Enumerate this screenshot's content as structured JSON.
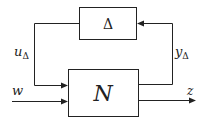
{
  "diagram": {
    "type": "block-diagram",
    "blocks": {
      "delta": {
        "label": "Δ"
      },
      "plant": {
        "label": "N"
      }
    },
    "signals": {
      "u_delta": {
        "base": "u",
        "sub": "Δ"
      },
      "y_delta": {
        "base": "y",
        "sub": "Δ"
      },
      "w": {
        "label": "w"
      },
      "z": {
        "label": "z"
      }
    }
  }
}
